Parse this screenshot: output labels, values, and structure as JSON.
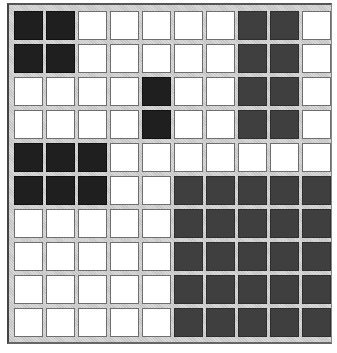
{
  "grid": {
    "rows": 10,
    "cols": 10,
    "legend": {
      "B": "black",
      "G": "dark-gray",
      "W": "white"
    },
    "colors": {
      "B": "#1f1f1f",
      "G": "#3f3f3f",
      "W": "#ffffff"
    },
    "cells": [
      [
        "B",
        "B",
        "W",
        "W",
        "W",
        "W",
        "W",
        "G",
        "G",
        "W"
      ],
      [
        "B",
        "B",
        "W",
        "W",
        "W",
        "W",
        "W",
        "G",
        "G",
        "W"
      ],
      [
        "W",
        "W",
        "W",
        "W",
        "B",
        "W",
        "W",
        "G",
        "G",
        "W"
      ],
      [
        "W",
        "W",
        "W",
        "W",
        "B",
        "W",
        "W",
        "G",
        "G",
        "W"
      ],
      [
        "B",
        "B",
        "B",
        "W",
        "W",
        "W",
        "W",
        "W",
        "W",
        "W"
      ],
      [
        "B",
        "B",
        "B",
        "W",
        "W",
        "G",
        "G",
        "G",
        "G",
        "G"
      ],
      [
        "W",
        "W",
        "W",
        "W",
        "W",
        "G",
        "G",
        "G",
        "G",
        "G"
      ],
      [
        "W",
        "W",
        "W",
        "W",
        "W",
        "G",
        "G",
        "G",
        "G",
        "G"
      ],
      [
        "W",
        "W",
        "W",
        "W",
        "W",
        "G",
        "G",
        "G",
        "G",
        "G"
      ],
      [
        "W",
        "W",
        "W",
        "W",
        "W",
        "G",
        "G",
        "G",
        "G",
        "G"
      ]
    ]
  }
}
